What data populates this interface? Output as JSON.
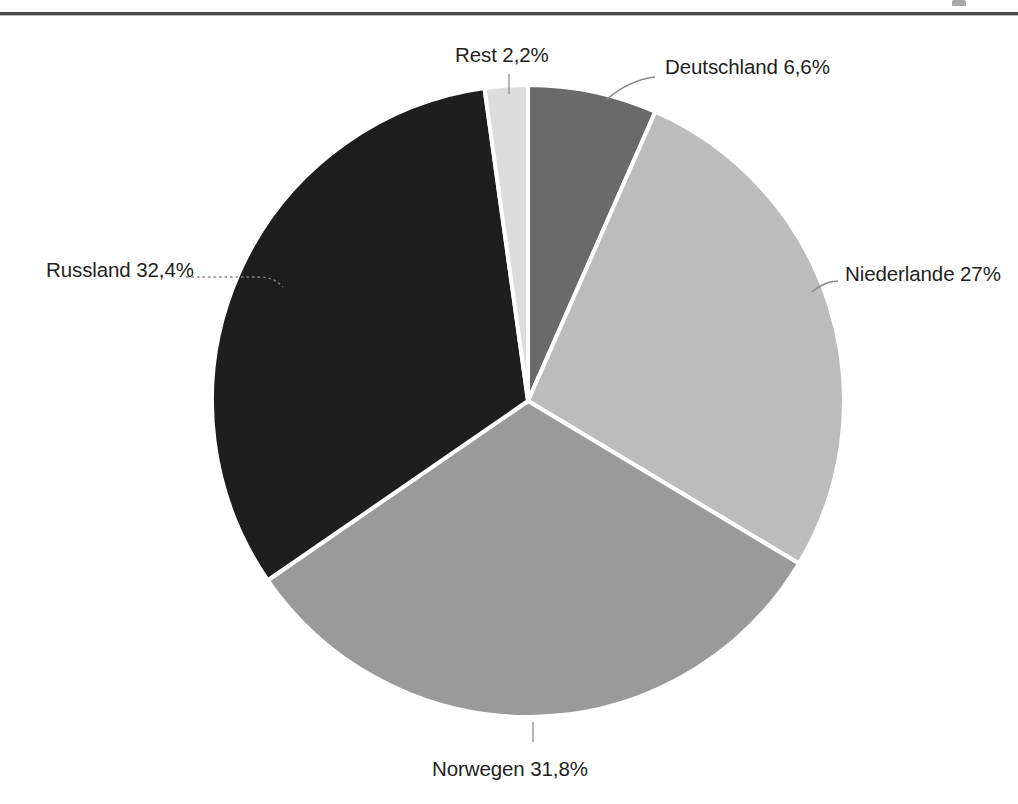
{
  "page": {
    "background_color": "#ffffff",
    "header_rule_color": "#4a4a4a"
  },
  "chart_data": {
    "type": "pie",
    "title": "",
    "subtitle": "",
    "xlabel": "",
    "ylabel": "",
    "legend_position": "none",
    "grid": false,
    "labels_format": "name value%",
    "decimal_separator": ",",
    "total": 100,
    "center": {
      "x": 528,
      "y": 401
    },
    "radius": 316,
    "start_angle_deg": -90,
    "direction": "clockwise",
    "categories": [
      "Deutschland",
      "Niederlande",
      "Norwegen",
      "Russland",
      "Rest"
    ],
    "values": [
      6.6,
      27,
      31.8,
      32.4,
      2.2
    ],
    "value_labels": [
      "6,6%",
      "27%",
      "31,8%",
      "32,4%",
      "2,2%"
    ],
    "colors": [
      "#6a6a6a",
      "#bcbcbc",
      "#9a9a9a",
      "#1e1e1e",
      "#dcdcdc"
    ],
    "slices": [
      {
        "name": "Deutschland",
        "value": 6.6,
        "label": "Deutschland 6,6%",
        "color": "#6a6a6a",
        "leader": "curve"
      },
      {
        "name": "Niederlande",
        "value": 27,
        "label": "Niederlande 27%",
        "color": "#bcbcbc",
        "leader": "curve"
      },
      {
        "name": "Norwegen",
        "value": 31.8,
        "label": "Norwegen 31,8%",
        "color": "#9a9a9a",
        "leader": "line"
      },
      {
        "name": "Russland",
        "value": 32.4,
        "label": "Russland 32,4%",
        "color": "#1e1e1e",
        "leader": "dotted"
      },
      {
        "name": "Rest",
        "value": 2.2,
        "label": "Rest 2,2%",
        "color": "#dcdcdc",
        "leader": "line"
      }
    ],
    "separator_color": "#ffffff",
    "separator_width": 4
  }
}
